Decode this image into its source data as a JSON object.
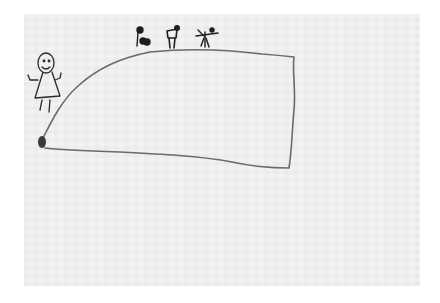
{
  "image": {
    "description": "Child's pencil drawing on paper: a large flat-topped hill/mountain shape with a girl figure on the left slope and three small stick figures standing on top",
    "paper_color": "#f3f3f3",
    "border_color": "#ffffff",
    "line_color": "#6a6a6a",
    "ink_color": "#1e1e1e"
  },
  "elements": {
    "hill": "large hill outline",
    "girl": "smiling girl with triangle dress and raised arms",
    "rock": "dark filled blob at base of hill",
    "figures_on_top": [
      "figure with round object",
      "figure holding flag-like shape",
      "stick figure with arms outstretched"
    ]
  }
}
